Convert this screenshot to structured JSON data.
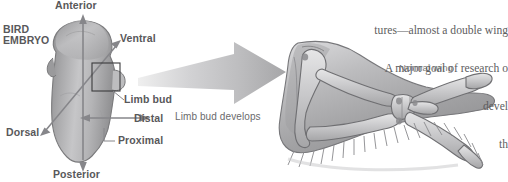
{
  "figure": {
    "title_text": "BIRD EMBRYO",
    "panel_left_name": "bird-embryo-diagram",
    "panel_right_name": "normal-wing-diagram"
  },
  "embryo": {
    "caption_line1": "BIRD",
    "caption_line2": "EMBRYO",
    "axes": [
      {
        "id": "anterior",
        "label": "Anterior"
      },
      {
        "id": "posterior",
        "label": "Posterior"
      },
      {
        "id": "ventral",
        "label": "Ventral"
      },
      {
        "id": "dorsal",
        "label": "Dorsal"
      },
      {
        "id": "distal",
        "label": "Distal"
      },
      {
        "id": "proximal",
        "label": "Proximal"
      }
    ],
    "limb_bud_label": "Limb bud"
  },
  "transition": {
    "arrow_label": "Limb bud develops",
    "arrow_name": "development-arrow"
  },
  "wing": {
    "label": "Normal wing"
  },
  "body_copy": {
    "line1": "tures—almost a double wing",
    "line2": "A major goal of research o",
    "line3": "devel",
    "line4": "th"
  },
  "colors": {
    "text_gray": "#58585a",
    "body_text": "#5d5d60",
    "arrow_gray": "#b9b9bb",
    "embryo_fill": "#b0b0b2",
    "wing_fill": "#b5b5b7",
    "background": "#ffffff"
  }
}
